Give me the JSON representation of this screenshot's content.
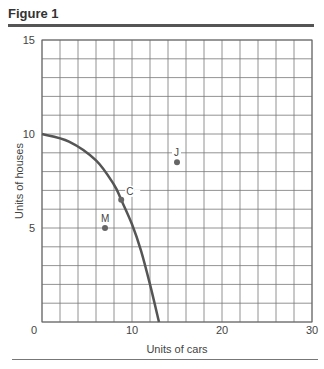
{
  "figure": {
    "title": "Figure 1"
  },
  "chart_data": {
    "type": "line",
    "title": "Figure 1",
    "xlabel": "Units of cars",
    "ylabel": "Units of houses",
    "xlim": [
      0,
      30
    ],
    "ylim": [
      0,
      15
    ],
    "x_ticks": [
      "0",
      "10",
      "20",
      "30"
    ],
    "y_ticks": [
      "5",
      "10",
      "15"
    ],
    "grid": true,
    "grid_x_step": 2,
    "grid_y_step": 1,
    "series": [
      {
        "name": "Production possibilities frontier",
        "x": [
          0,
          3,
          6,
          8,
          8.8,
          10,
          11,
          12,
          13
        ],
        "y": [
          10,
          9.6,
          8.6,
          7.3,
          6.5,
          5.2,
          3.8,
          2.0,
          0
        ]
      }
    ],
    "points": [
      {
        "label": "C",
        "x": 8.8,
        "y": 6.5
      },
      {
        "label": "M",
        "x": 7,
        "y": 5
      },
      {
        "label": "J",
        "x": 15,
        "y": 8.5
      }
    ],
    "colors": {
      "curve": "#555555",
      "points": "#666666",
      "grid": "#777777"
    }
  }
}
